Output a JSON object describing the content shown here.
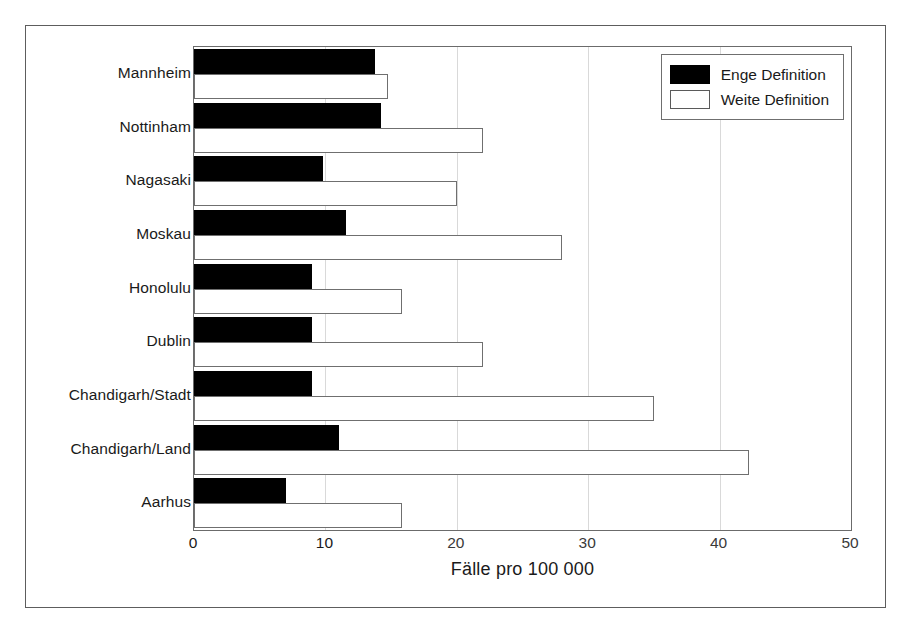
{
  "chart_data": {
    "type": "bar",
    "orientation": "horizontal",
    "title": "",
    "xlabel": "Fälle pro 100 000",
    "ylabel": "",
    "xlim": [
      0,
      50
    ],
    "xticks": [
      0,
      10,
      20,
      30,
      40,
      50
    ],
    "xtick_labels": [
      "0",
      "10",
      "20",
      "30",
      "40",
      "50"
    ],
    "grid": true,
    "grid_axis": "x",
    "legend_position": "top-right",
    "categories": [
      "Mannheim",
      "Nottinham",
      "Nagasaki",
      "Moskau",
      "Honolulu",
      "Dublin",
      "Chandigarh/Stadt",
      "Chandigarh/Land",
      "Aarhus"
    ],
    "series": [
      {
        "name": "Enge Definition",
        "color": "#000000",
        "style": "filled",
        "values": [
          13.8,
          14.2,
          9.8,
          11.6,
          9.0,
          9.0,
          9.0,
          11.0,
          7.0
        ]
      },
      {
        "name": "Weite Definition",
        "color": "#ffffff",
        "style": "hollow",
        "values": [
          14.8,
          22.0,
          20.0,
          28.0,
          15.8,
          22.0,
          35.0,
          42.2,
          15.8
        ]
      }
    ]
  },
  "legend": {
    "entries": [
      {
        "label": "Enge Definition",
        "swatch": "filled"
      },
      {
        "label": "Weite Definition",
        "swatch": "hollow"
      }
    ]
  },
  "axis": {
    "x_title": "Fälle pro 100 000"
  }
}
